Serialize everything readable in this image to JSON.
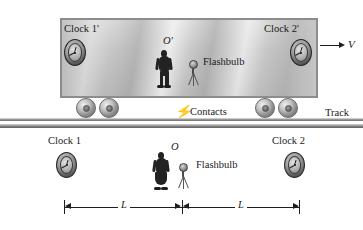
{
  "figure": {
    "type": "physics-diagram"
  },
  "boxcar": {
    "velocity_label": "V",
    "clock_left_label": "Clock 1'",
    "clock_right_label": "Clock 2'",
    "observer_label": "O'",
    "flashbulb_label": "Flashbulb",
    "contacts_label": "Contacts"
  },
  "ground": {
    "track_label": "Track",
    "clock_left_label": "Clock 1",
    "clock_right_label": "Clock 2",
    "observer_label": "O",
    "flashbulb_label": "Flashbulb"
  },
  "dimensions": {
    "left_span_label": "L",
    "right_span_label": "L"
  },
  "icons": {
    "clock": "analog-clock-icon",
    "wheel": "train-wheel-icon",
    "bulb": "flashbulb-icon",
    "spark": "spark-icon",
    "velocity_arrow": "right-arrow-icon"
  },
  "colors": {
    "ink": "#1a1a1a",
    "car_body": "#c9c9c9",
    "car_border": "#8d8d8d",
    "rail": "#8b8b8b",
    "silhouette": "#232323"
  }
}
